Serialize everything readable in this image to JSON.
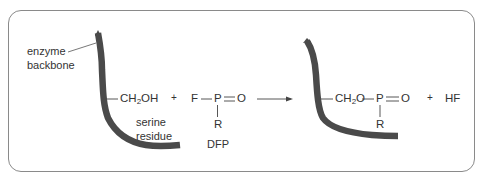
{
  "labels": {
    "enzyme_backbone_line1": "enzyme",
    "enzyme_backbone_line2": "backbone",
    "serine_line1": "serine",
    "serine_line2": "residue",
    "dfp": "DFP"
  },
  "reactants": {
    "serine_group_prefix": "CH",
    "serine_group_sub": "2",
    "serine_group_suffix": "OH",
    "plus": "+",
    "dfp_F": "F",
    "dfp_P": "P",
    "dfp_O": "O",
    "dfp_R": "R"
  },
  "products": {
    "group_prefix": "CH",
    "group_sub": "2",
    "group_suffix": "O",
    "P": "P",
    "O": "O",
    "R": "R",
    "plus": "+",
    "byproduct": "HF"
  },
  "colors": {
    "backbone": "#4a4a4a",
    "border": "#8a8a8a",
    "text": "#333333"
  }
}
